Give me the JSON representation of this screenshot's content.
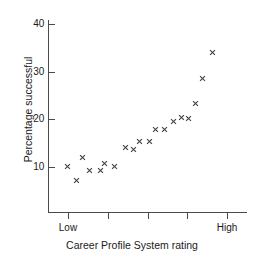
{
  "chart_data": {
    "type": "scatter",
    "title": "",
    "xlabel": "Career Profile System rating",
    "ylabel": "Percentage successful",
    "xlim": [
      0,
      10
    ],
    "ylim": [
      0,
      40
    ],
    "ytick_values": [
      10,
      20,
      30,
      40
    ],
    "ytick_labels": [
      "10",
      "20",
      "30",
      "40"
    ],
    "xtick_values": [
      1,
      3,
      5,
      7,
      9
    ],
    "xtick_labels": [
      "Low",
      "",
      "",
      "",
      "High"
    ],
    "xtick_label_low": "Low",
    "xtick_label_high": "High",
    "grid": false,
    "legend": false,
    "marker": "x",
    "marker_color": "#3a3a3a",
    "axis_color": "#4a4a4a",
    "points": [
      {
        "x": 1.0,
        "y": 10.2
      },
      {
        "x": 1.45,
        "y": 7.1
      },
      {
        "x": 1.72,
        "y": 11.9
      },
      {
        "x": 2.1,
        "y": 9.2
      },
      {
        "x": 2.63,
        "y": 9.2
      },
      {
        "x": 2.83,
        "y": 10.8
      },
      {
        "x": 3.34,
        "y": 10.2
      },
      {
        "x": 3.88,
        "y": 14.1
      },
      {
        "x": 4.28,
        "y": 13.6
      },
      {
        "x": 4.58,
        "y": 15.3
      },
      {
        "x": 5.1,
        "y": 15.3
      },
      {
        "x": 5.38,
        "y": 17.9
      },
      {
        "x": 5.87,
        "y": 17.8
      },
      {
        "x": 6.3,
        "y": 19.5
      },
      {
        "x": 6.72,
        "y": 20.5
      },
      {
        "x": 7.08,
        "y": 20.2
      },
      {
        "x": 7.4,
        "y": 23.4
      },
      {
        "x": 7.76,
        "y": 28.5
      },
      {
        "x": 8.28,
        "y": 34.1
      }
    ]
  }
}
